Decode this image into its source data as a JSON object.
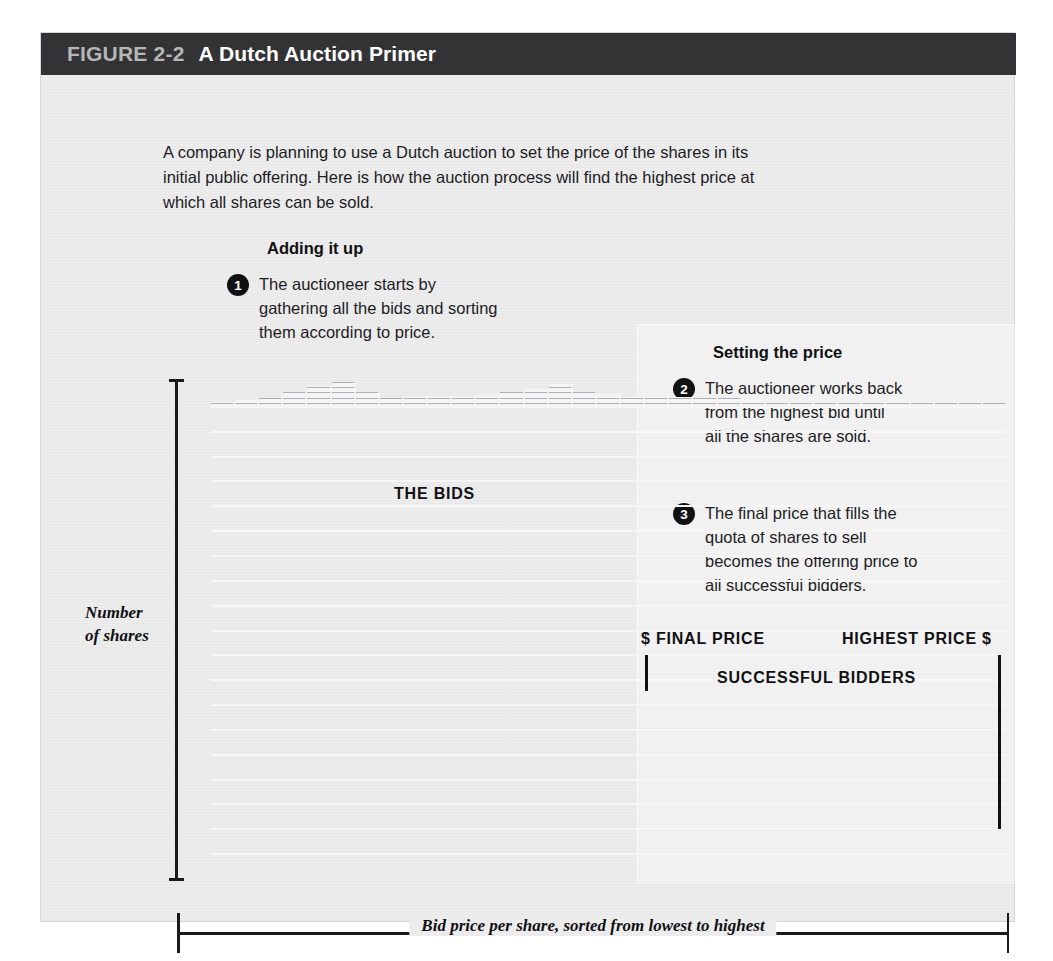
{
  "figure": {
    "label": "FIGURE 2-2",
    "name": "A Dutch Auction Primer",
    "intro": "A company is planning to use a Dutch auction to set the price of the shares in its initial public offering. Here is how the auction process will find the highest price at which all shares can be sold."
  },
  "sections": {
    "adding": {
      "heading": "Adding it up",
      "steps": [
        {
          "number": "1",
          "text": "The auctioneer starts by gathering all the bids and sorting them according to price."
        }
      ]
    },
    "setting": {
      "heading": "Setting the price",
      "steps": [
        {
          "number": "2",
          "text": "The auctioneer works back from the highest bid until all the shares are sold."
        },
        {
          "number": "3",
          "text": "The final price that fills the quota of shares to sell becomes the offering price to all successful bidders."
        }
      ]
    }
  },
  "annotations": {
    "the_bids": "THE BIDS",
    "final_price": "$ FINAL PRICE",
    "highest_price": "HIGHEST PRICE $",
    "successful_bidders": "SUCCESSFUL BIDDERS"
  },
  "axes": {
    "y_label": "Number of shares",
    "y_label_line1": "Number",
    "y_label_line2": "of shares",
    "x_label": "Bid price per share, sorted from lowest to highest"
  },
  "colors": {
    "title_bar": "#333335",
    "title_label": "#b6b6b8",
    "title_name": "#ffffff",
    "card_background": "#ececed",
    "bar_fill": "#6a6a6c",
    "gridline": "#f6f6f7",
    "axis": "#1a1a1c",
    "badge": "#111113"
  },
  "chart_data": {
    "type": "bar",
    "title": "THE BIDS",
    "xlabel": "Bid price per share, sorted from lowest to highest",
    "ylabel": "Number of shares",
    "grid": true,
    "legend": "none",
    "rows": 20,
    "columns": 33,
    "ylim": [
      0,
      20
    ],
    "unit": "shares (one cell = one unit)",
    "categories": [
      "1",
      "2",
      "3",
      "4",
      "5",
      "6",
      "7",
      "8",
      "9",
      "10",
      "11",
      "12",
      "13",
      "14",
      "15",
      "16",
      "17",
      "18",
      "19",
      "20",
      "21",
      "22",
      "23",
      "24",
      "25",
      "26",
      "27",
      "28",
      "29",
      "30",
      "31",
      "32",
      "33"
    ],
    "values": [
      3,
      5,
      6,
      11,
      16,
      19,
      11,
      6,
      8,
      8,
      8,
      9,
      11,
      14,
      18,
      11,
      10,
      7,
      8,
      7,
      6,
      6,
      5,
      3,
      2,
      2,
      2,
      3,
      4,
      3,
      2,
      2,
      2
    ],
    "final_price_column": 24,
    "highest_price_column": 33,
    "successful_bidders_from_column": 24,
    "annotations": [
      {
        "text": "THE BIDS",
        "kind": "label"
      },
      {
        "text": "$ FINAL PRICE",
        "kind": "pointer",
        "column": 24
      },
      {
        "text": "HIGHEST PRICE $",
        "kind": "pointer",
        "column": 33
      },
      {
        "text": "SUCCESSFUL BIDDERS",
        "kind": "span",
        "from_column": 24,
        "to_column": 33
      }
    ]
  }
}
